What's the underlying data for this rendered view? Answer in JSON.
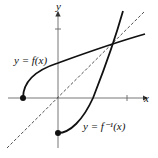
{
  "diagram": {
    "axes": {
      "x_label": "x",
      "y_label": "y"
    },
    "curves": [
      {
        "name": "f",
        "label": "y = f(x)"
      },
      {
        "name": "f_inverse",
        "label": "y = f⁻¹(x)"
      },
      {
        "name": "identity",
        "label": "y = x",
        "style": "dashed"
      }
    ],
    "colors": {
      "curve": "#111111",
      "axis": "#555555"
    }
  }
}
